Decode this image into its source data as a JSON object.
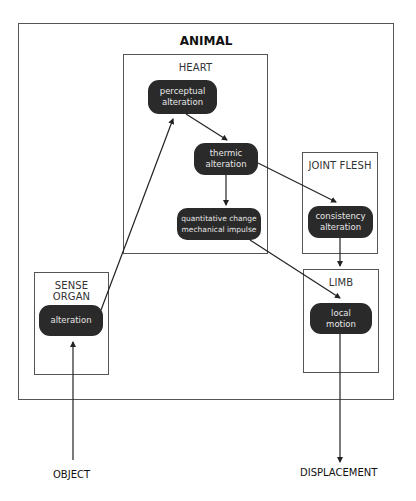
{
  "diagram": {
    "outer": {
      "title": "ANIMAL"
    },
    "containers": {
      "heart": {
        "label": "HEART"
      },
      "joint_flesh": {
        "label": "JOINT FLESH"
      },
      "limb": {
        "label": "LIMB"
      },
      "sense_organ": {
        "label": "SENSE ORGAN"
      }
    },
    "nodes": {
      "perceptual": {
        "line1": "perceptual",
        "line2": "alteration"
      },
      "thermic": {
        "line1": "thermic",
        "line2": "alteration"
      },
      "quantitative": {
        "line1": "quantitative change",
        "line2": "mechanical impulse"
      },
      "consistency": {
        "line1": "consistency",
        "line2": "alteration"
      },
      "local_motion": {
        "line1": "local",
        "line2": "motion"
      },
      "sense_alteration": {
        "line1": "alteration"
      }
    },
    "external": {
      "object": "OBJECT",
      "displacement": "DISPLACEMENT"
    },
    "edges": [
      {
        "from": "OBJECT",
        "to": "alteration (sense organ)"
      },
      {
        "from": "alteration (sense organ)",
        "to": "perceptual alteration"
      },
      {
        "from": "perceptual alteration",
        "to": "thermic alteration"
      },
      {
        "from": "thermic alteration",
        "to": "quantitative change mechanical impulse"
      },
      {
        "from": "thermic alteration",
        "to": "consistency alteration"
      },
      {
        "from": "quantitative change mechanical impulse",
        "to": "local motion"
      },
      {
        "from": "consistency alteration",
        "to": "local motion"
      },
      {
        "from": "local motion",
        "to": "DISPLACEMENT"
      }
    ],
    "colors": {
      "node_fill": "#2a2a2a",
      "node_text": "#e6e6e6",
      "line": "#222222",
      "box_border": "#555555"
    }
  }
}
